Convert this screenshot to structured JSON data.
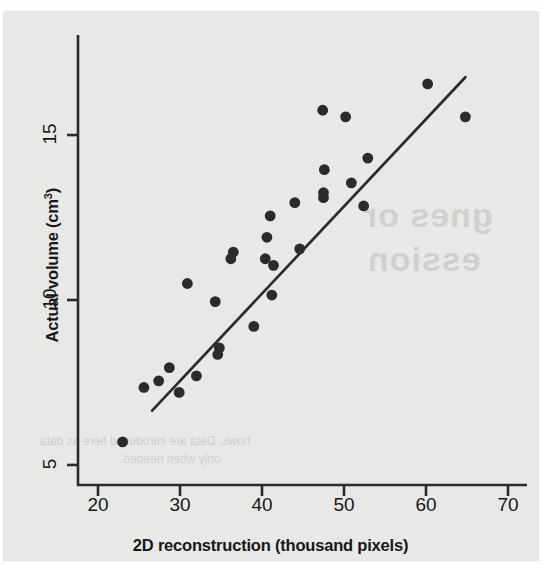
{
  "figure": {
    "background_color": "#e8e8e6",
    "ink_color": "#2b2b2d",
    "ghost_text": {
      "line1": "gnes or",
      "line2": "ession",
      "line3": "hows. Data are introduced here as data",
      "line4": "only when needed."
    }
  },
  "chart_data": {
    "type": "scatter",
    "title": "",
    "xlabel": "2D reconstruction (thousand pixels)",
    "ylabel_text": "Actual volume (cm",
    "ylabel_superscript": "3",
    "ylabel_tail": ")",
    "xlim": [
      18.0,
      72.0
    ],
    "ylim": [
      4.2,
      16.8
    ],
    "xticks": [
      20,
      30,
      40,
      50,
      60,
      70
    ],
    "yticks": [
      5,
      10,
      15
    ],
    "xtick_labels": [
      "20",
      "30",
      "40",
      "50",
      "60",
      "70"
    ],
    "ytick_labels": [
      "5",
      "10",
      "15"
    ],
    "grid": false,
    "legend": null,
    "marker": {
      "shape": "circle",
      "color": "#2b2b2d",
      "radius_px": 5.4
    },
    "points": [
      {
        "x": 23.0,
        "y": 5.7
      },
      {
        "x": 25.6,
        "y": 7.35
      },
      {
        "x": 27.4,
        "y": 7.55
      },
      {
        "x": 28.7,
        "y": 7.95
      },
      {
        "x": 29.9,
        "y": 7.2
      },
      {
        "x": 30.9,
        "y": 10.5
      },
      {
        "x": 32.0,
        "y": 7.7
      },
      {
        "x": 34.3,
        "y": 9.95
      },
      {
        "x": 34.6,
        "y": 8.35
      },
      {
        "x": 34.8,
        "y": 8.55
      },
      {
        "x": 36.2,
        "y": 11.25
      },
      {
        "x": 36.5,
        "y": 11.45
      },
      {
        "x": 39.0,
        "y": 9.2
      },
      {
        "x": 40.4,
        "y": 11.25
      },
      {
        "x": 40.6,
        "y": 11.9
      },
      {
        "x": 41.0,
        "y": 12.55
      },
      {
        "x": 41.2,
        "y": 10.15
      },
      {
        "x": 41.4,
        "y": 11.05
      },
      {
        "x": 44.0,
        "y": 12.95
      },
      {
        "x": 44.6,
        "y": 11.55
      },
      {
        "x": 47.4,
        "y": 15.75
      },
      {
        "x": 47.5,
        "y": 13.1
      },
      {
        "x": 47.5,
        "y": 13.25
      },
      {
        "x": 47.6,
        "y": 13.95
      },
      {
        "x": 50.2,
        "y": 15.55
      },
      {
        "x": 50.9,
        "y": 13.55
      },
      {
        "x": 52.4,
        "y": 12.85
      },
      {
        "x": 52.9,
        "y": 14.3
      },
      {
        "x": 60.2,
        "y": 16.55
      },
      {
        "x": 64.8,
        "y": 15.55
      }
    ],
    "trendline": {
      "type": "linear-fit",
      "color": "#2b2b2d",
      "x_start": 26.6,
      "y_start": 6.65,
      "x_end": 64.8,
      "y_end": 16.75
    }
  }
}
